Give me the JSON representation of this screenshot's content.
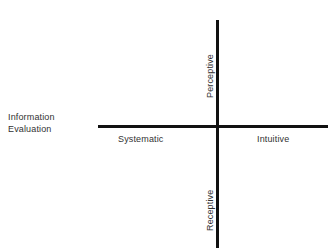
{
  "figure": {
    "background_color": "#ffffff",
    "line_color": "#111111",
    "text_color": "#323232"
  },
  "dimension_label": {
    "line1": "Information",
    "line2": "Evaluation"
  },
  "axes": {
    "horizontal": {
      "name": "information-evaluation",
      "left_pole": "Systematic",
      "right_pole": "Intuitive"
    },
    "vertical": {
      "name": "information-gathering",
      "top_pole": "Perceptive",
      "bottom_pole": "Receptive"
    }
  },
  "chart_data": {
    "type": "scatter",
    "title": "",
    "subtitle": "",
    "xlabel": "",
    "ylabel": "",
    "grid": false,
    "legend": null,
    "axis_style": "crossed-quadrant-axes",
    "series": [],
    "values": [],
    "categories": [],
    "annotations": [
      {
        "text": "Information",
        "position": "left-outer",
        "rotation": 0
      },
      {
        "text": "Evaluation",
        "position": "left-outer",
        "rotation": 0
      },
      {
        "text": "Systematic",
        "position": "x-negative",
        "rotation": 0
      },
      {
        "text": "Intuitive",
        "position": "x-positive",
        "rotation": 0
      },
      {
        "text": "Perceptive",
        "position": "y-positive",
        "rotation": -90
      },
      {
        "text": "Receptive",
        "position": "y-negative",
        "rotation": -90
      }
    ]
  }
}
